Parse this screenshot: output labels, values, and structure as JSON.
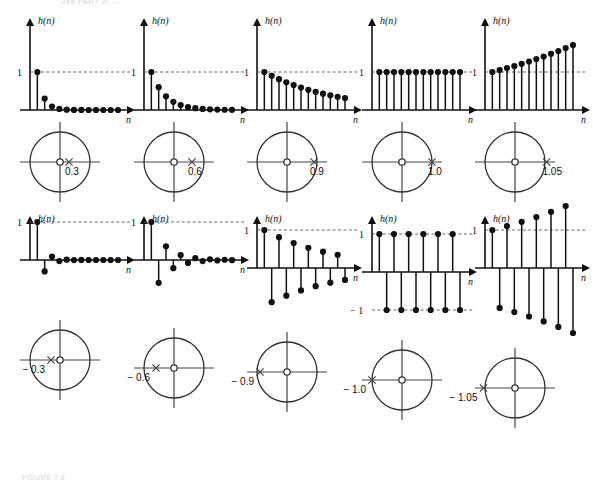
{
  "page": {
    "header": "266  PART 2/ ...",
    "caption": "FIGURE 7.6"
  },
  "axis_labels": {
    "y": "h(n)",
    "x": "n",
    "one": "1",
    "neg_one": "− 1"
  },
  "chart_data": {
    "type": "line",
    "xlabel": "n",
    "ylabel": "h(n)",
    "grid": false,
    "legend": "none",
    "panels": [
      {
        "id": "p1",
        "row": 1,
        "col": 1,
        "a": 0.3,
        "pole_label": "0.3",
        "pole_x": 0.3,
        "pole_inside_unit_circle": true,
        "ref_lines": [
          1
        ],
        "x": [
          0,
          1,
          2,
          3,
          4,
          5,
          6,
          7,
          8,
          9,
          10,
          11
        ],
        "values": [
          1,
          0.3,
          0.09,
          0.027,
          0.008,
          0.002,
          0.001,
          0.0,
          0.0,
          0.0,
          0.0,
          0.0
        ]
      },
      {
        "id": "p2",
        "row": 1,
        "col": 2,
        "a": 0.6,
        "pole_label": "0.6",
        "pole_x": 0.6,
        "pole_inside_unit_circle": true,
        "ref_lines": [
          1
        ],
        "x": [
          0,
          1,
          2,
          3,
          4,
          5,
          6,
          7,
          8,
          9,
          10,
          11
        ],
        "values": [
          1,
          0.6,
          0.36,
          0.216,
          0.13,
          0.078,
          0.047,
          0.028,
          0.017,
          0.01,
          0.006,
          0.004
        ]
      },
      {
        "id": "p3",
        "row": 1,
        "col": 3,
        "a": 0.9,
        "pole_label": "0.9",
        "pole_x": 0.9,
        "pole_inside_unit_circle": true,
        "ref_lines": [
          1
        ],
        "x": [
          0,
          1,
          2,
          3,
          4,
          5,
          6,
          7,
          8,
          9,
          10,
          11
        ],
        "values": [
          1,
          0.9,
          0.81,
          0.729,
          0.656,
          0.59,
          0.531,
          0.478,
          0.43,
          0.387,
          0.349,
          0.314
        ]
      },
      {
        "id": "p4",
        "row": 1,
        "col": 4,
        "a": 1.0,
        "pole_label": "1.0",
        "pole_x": 1.0,
        "pole_inside_unit_circle": false,
        "ref_lines": [
          1
        ],
        "x": [
          0,
          1,
          2,
          3,
          4,
          5,
          6,
          7,
          8,
          9,
          10,
          11
        ],
        "values": [
          1,
          1,
          1,
          1,
          1,
          1,
          1,
          1,
          1,
          1,
          1,
          1
        ]
      },
      {
        "id": "p5",
        "row": 1,
        "col": 5,
        "a": 1.05,
        "pole_label": "1.05",
        "pole_x": 1.05,
        "pole_inside_unit_circle": false,
        "ref_lines": [
          1
        ],
        "x": [
          0,
          1,
          2,
          3,
          4,
          5,
          6,
          7,
          8,
          9,
          10,
          11
        ],
        "values": [
          1,
          1.05,
          1.103,
          1.158,
          1.216,
          1.276,
          1.34,
          1.407,
          1.477,
          1.551,
          1.629,
          1.71
        ]
      },
      {
        "id": "p6",
        "row": 2,
        "col": 1,
        "a": -0.3,
        "pole_label": "− 0.3",
        "pole_x": -0.3,
        "pole_inside_unit_circle": true,
        "ref_lines": [
          1
        ],
        "x": [
          0,
          1,
          2,
          3,
          4,
          5,
          6,
          7,
          8,
          9,
          10,
          11
        ],
        "values": [
          1,
          -0.3,
          0.09,
          -0.027,
          0.008,
          -0.002,
          0.001,
          0.0,
          0.0,
          0.0,
          0.0,
          0.0
        ]
      },
      {
        "id": "p7",
        "row": 2,
        "col": 2,
        "a": -0.6,
        "pole_label": "− 0.6",
        "pole_x": -0.6,
        "pole_inside_unit_circle": true,
        "ref_lines": [
          1
        ],
        "x": [
          0,
          1,
          2,
          3,
          4,
          5,
          6,
          7,
          8,
          9,
          10,
          11
        ],
        "values": [
          1,
          -0.6,
          0.36,
          -0.216,
          0.13,
          -0.078,
          0.047,
          -0.028,
          0.017,
          -0.01,
          0.006,
          -0.004
        ]
      },
      {
        "id": "p8",
        "row": 2,
        "col": 3,
        "a": -0.9,
        "pole_label": "− 0.9",
        "pole_x": -0.9,
        "pole_inside_unit_circle": true,
        "ref_lines": [
          1
        ],
        "x": [
          0,
          1,
          2,
          3,
          4,
          5,
          6,
          7,
          8,
          9,
          10,
          11
        ],
        "values": [
          1,
          -0.9,
          0.81,
          -0.729,
          0.656,
          -0.59,
          0.531,
          -0.478,
          0.43,
          -0.387,
          0.349,
          -0.314
        ]
      },
      {
        "id": "p9",
        "row": 2,
        "col": 4,
        "a": -1.0,
        "pole_label": "− 1.0",
        "pole_x": -1.0,
        "pole_inside_unit_circle": false,
        "ref_lines": [
          1,
          -1
        ],
        "x": [
          0,
          1,
          2,
          3,
          4,
          5,
          6,
          7,
          8,
          9,
          10,
          11
        ],
        "values": [
          1,
          -1,
          1,
          -1,
          1,
          -1,
          1,
          -1,
          1,
          -1,
          1,
          -1
        ]
      },
      {
        "id": "p10",
        "row": 2,
        "col": 5,
        "a": -1.05,
        "pole_label": "− 1.05",
        "pole_x": -1.05,
        "pole_inside_unit_circle": false,
        "ref_lines": [
          1
        ],
        "x": [
          0,
          1,
          2,
          3,
          4,
          5,
          6,
          7,
          8,
          9,
          10,
          11
        ],
        "values": [
          1,
          -1.05,
          1.103,
          -1.158,
          1.216,
          -1.276,
          1.34,
          -1.407,
          1.477,
          -1.551,
          1.629,
          -1.71
        ]
      }
    ]
  }
}
